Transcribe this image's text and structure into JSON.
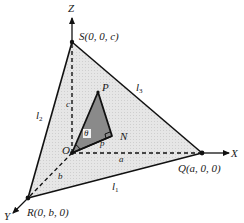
{
  "diagram": {
    "colors": {
      "face_fill": "#e4e4e4",
      "inner_triangle_fill": "#8a8a8a",
      "line": "#111111",
      "background": "#ffffff"
    },
    "axes": {
      "x_label": "X",
      "y_label": "Y",
      "z_label": "Z"
    },
    "points": {
      "origin": "O",
      "S": "S(0, 0, c)",
      "Q": "Q(a, 0, 0)",
      "R": "R(0, b, 0)",
      "P": "P",
      "N": "N"
    },
    "edges": {
      "l1": "l",
      "l1_sub": "1",
      "l2": "l",
      "l2_sub": "2",
      "l3": "l",
      "l3_sub": "3"
    },
    "segment_labels": {
      "c": "c",
      "a": "a",
      "b": "b",
      "p": "p",
      "angle": "θ"
    }
  }
}
